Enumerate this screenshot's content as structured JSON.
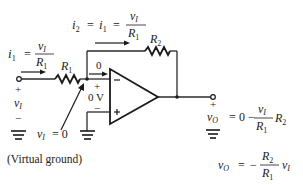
{
  "circuit": {
    "type": "inverting op-amp amplifier",
    "labels": {
      "i1_eq": "i",
      "i1_sub": "1",
      "eq": "=",
      "vI_num": "v",
      "vI_sub": "I",
      "R": "R",
      "R1_sub": "1",
      "R2_sub": "2",
      "i2_sub": "2",
      "zero_current": "0",
      "plus": "+",
      "minus": "−",
      "zero_volt": "0 V",
      "virtual_ground_eq": "= 0",
      "virtual_ground_note": "(Virtual ground)",
      "vO_sub": "O",
      "vo_eq1_rhs_zero": "0 −",
      "vo_eq2_rhs": "−"
    },
    "components": {
      "R1": "R1",
      "R2": "R2",
      "opamp": "op-amp"
    },
    "equations": [
      "i1 = vI / R1",
      "i2 = i1 = vI / R1",
      "vO = 0 − (vI / R1) R2",
      "vO = −(R2 / R1) vI"
    ],
    "colors": {
      "ink": "#222222",
      "background": "#ffffff"
    }
  }
}
